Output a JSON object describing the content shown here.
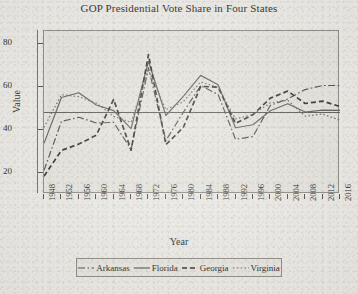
{
  "chart_data": {
    "type": "line",
    "title": "GOP Presidential Vote Share in Four States",
    "xlabel": "Year",
    "ylabel": "Value",
    "xlim": [
      1948,
      2016
    ],
    "ylim": [
      10,
      86
    ],
    "yticks": [
      20,
      40,
      60,
      80
    ],
    "grid": false,
    "legend_position": "bottom",
    "reference_line": {
      "orientation": "horizontal",
      "value": 48
    },
    "categories": [
      1948,
      1952,
      1956,
      1960,
      1964,
      1968,
      1972,
      1976,
      1980,
      1984,
      1988,
      1992,
      1996,
      2000,
      2004,
      2008,
      2012,
      2016
    ],
    "x": [
      1948,
      1952,
      1956,
      1960,
      1964,
      1968,
      1972,
      1976,
      1980,
      1984,
      1988,
      1992,
      1996,
      2000,
      2004,
      2008,
      2012,
      2016
    ],
    "series": [
      {
        "name": "Arkansas",
        "style": "dash-dot",
        "color": "#4a4843",
        "values": [
          21.0,
          43.8,
          45.8,
          43.1,
          43.4,
          30.8,
          68.9,
          34.9,
          48.1,
          60.5,
          56.4,
          35.5,
          36.8,
          51.3,
          54.3,
          58.7,
          60.6,
          60.6
        ]
      },
      {
        "name": "Florida",
        "style": "solid",
        "color": "#595751",
        "values": [
          33.6,
          55.0,
          57.2,
          51.5,
          48.9,
          40.5,
          71.9,
          46.6,
          55.5,
          65.3,
          60.9,
          40.9,
          42.3,
          48.8,
          52.1,
          48.2,
          49.1,
          49.0
        ]
      },
      {
        "name": "Georgia",
        "style": "dashed",
        "color": "#2b2a27",
        "values": [
          18.3,
          30.3,
          33.3,
          37.4,
          54.1,
          30.4,
          75.0,
          33.0,
          41.0,
          60.2,
          59.8,
          42.9,
          47.0,
          54.7,
          58.0,
          52.2,
          53.3,
          50.8
        ]
      },
      {
        "name": "Virginia",
        "style": "dotted",
        "color": "#6a6861",
        "values": [
          41.0,
          56.3,
          55.4,
          52.4,
          46.2,
          43.4,
          67.8,
          49.3,
          53.0,
          62.3,
          59.7,
          45.0,
          47.1,
          52.5,
          53.7,
          46.3,
          47.3,
          44.4
        ]
      }
    ]
  },
  "legend": {
    "items": [
      {
        "label": "Arkansas",
        "key": "dash-dot-key"
      },
      {
        "label": "Florida",
        "key": "solid-key"
      },
      {
        "label": "Georgia",
        "key": "dashed-key"
      },
      {
        "label": "Virginia",
        "key": "dotted-key"
      }
    ]
  }
}
